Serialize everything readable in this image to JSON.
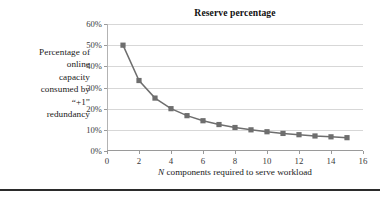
{
  "chart_data": {
    "type": "line",
    "title": "Reserve percentage",
    "xlabel_prefix": "N",
    "xlabel_rest": " components required to serve workload",
    "xlabel": "N components required to serve workload",
    "ylabel": "Percentage of online capacity consumed by “+1” redundancy",
    "ylabel_lines": [
      "Percentage of",
      "online",
      "capacity",
      "consumed by",
      "“+1”",
      "redundancy"
    ],
    "x": [
      1,
      2,
      3,
      4,
      5,
      6,
      7,
      8,
      9,
      10,
      11,
      12,
      13,
      14,
      15
    ],
    "values": [
      50.0,
      33.3,
      25.0,
      20.0,
      16.7,
      14.3,
      12.5,
      11.1,
      10.0,
      9.1,
      8.3,
      7.7,
      7.1,
      6.7,
      6.3
    ],
    "xlim": [
      0,
      16
    ],
    "ylim": [
      0,
      60
    ],
    "xticks": [
      0,
      2,
      4,
      6,
      8,
      10,
      12,
      14,
      16
    ],
    "xtick_labels": [
      "0",
      "2",
      "4",
      "6",
      "8",
      "10",
      "12",
      "14",
      "16"
    ],
    "yticks": [
      0,
      10,
      20,
      30,
      40,
      50,
      60
    ],
    "ytick_labels": [
      "0%",
      "10%",
      "20%",
      "30%",
      "40%",
      "50%",
      "60%"
    ],
    "grid": "horizontal",
    "legend": "none",
    "marker": "square",
    "series_color": "#6e6e6e",
    "gridline_color": "#d7d7d7",
    "axis_color": "#9a9a9a",
    "title_color": "#111111"
  }
}
